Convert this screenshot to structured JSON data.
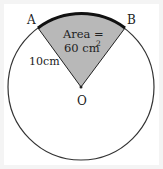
{
  "diagram": {
    "type": "circle-sector",
    "points": {
      "A": "A",
      "B": "B",
      "O": "O"
    },
    "radius_label": "10",
    "radius_unit": "cm",
    "area_label_line1": "Area =",
    "area_label_line2": "60 cm",
    "area_exponent": "2",
    "colors": {
      "sector_fill": "#b8b8b8",
      "circle_stroke": "#333333",
      "arc_stroke": "#111111",
      "background": "#f4f4f4",
      "circle_fill": "#ffffff"
    }
  }
}
